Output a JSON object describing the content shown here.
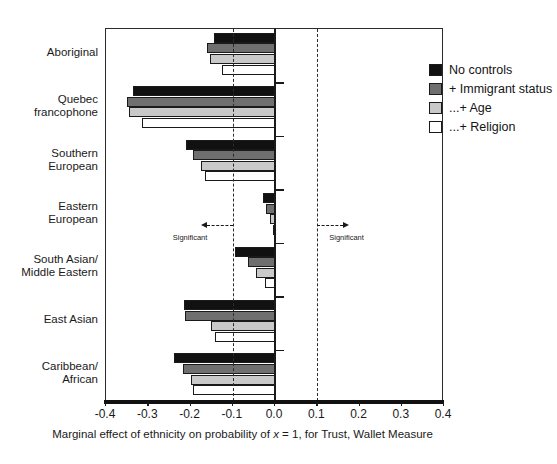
{
  "chart_data": {
    "type": "bar",
    "orientation": "horizontal",
    "title": "",
    "xlabel": "Marginal effect of ethnicity on probability of x = 1, for Trust, Wallet Measure",
    "ylabel": "",
    "xlim": [
      -0.4,
      0.4
    ],
    "xticks": [
      "-0.4",
      "-0.3",
      "-0.2",
      "-0.1",
      "0.0",
      "0.1",
      "0.2",
      "0.3",
      "0.4"
    ],
    "xtick_values": [
      -0.4,
      -0.3,
      -0.2,
      -0.1,
      0.0,
      0.1,
      0.2,
      0.3,
      0.4
    ],
    "grid": false,
    "legend_position": "top-right",
    "categories": [
      "Aboriginal",
      "Quebec francophone",
      "Southern European",
      "Eastern European",
      "South Asian/ Middle Eastern",
      "East Asian",
      "Caribbean/ African"
    ],
    "category_lines": [
      [
        "Aboriginal"
      ],
      [
        "Quebec",
        "francophone"
      ],
      [
        "Southern",
        "European"
      ],
      [
        "Eastern",
        "European"
      ],
      [
        "South Asian/",
        "Middle Eastern"
      ],
      [
        "East Asian"
      ],
      [
        "Caribbean/",
        "African"
      ]
    ],
    "series": [
      {
        "name": "No controls",
        "color": "#111111",
        "values": [
          -0.145,
          -0.335,
          -0.21,
          -0.028,
          -0.095,
          -0.215,
          -0.24
        ]
      },
      {
        "name": "+ Immigrant status",
        "color": "#6f6f6f",
        "values": [
          -0.16,
          -0.35,
          -0.195,
          -0.022,
          -0.064,
          -0.212,
          -0.218
        ]
      },
      {
        "name": "...+ Age",
        "color": "#c9c9c9",
        "values": [
          -0.155,
          -0.345,
          -0.175,
          -0.012,
          -0.045,
          -0.152,
          -0.2
        ]
      },
      {
        "name": "...+ Religion",
        "color": "#ffffff",
        "values": [
          -0.125,
          -0.315,
          -0.165,
          -0.005,
          -0.024,
          -0.142,
          -0.195
        ]
      }
    ],
    "reference_lines": [
      {
        "value": 0.0,
        "style": "solid",
        "label": "zero"
      },
      {
        "value": -0.1,
        "style": "dashed",
        "label": "significance-negative"
      },
      {
        "value": 0.1,
        "style": "dashed",
        "label": "significance-positive"
      }
    ],
    "annotations": [
      {
        "text": "Significant",
        "at": -0.1,
        "direction": "left"
      },
      {
        "text": "Significant",
        "at": 0.1,
        "direction": "right"
      }
    ]
  },
  "legend": {
    "items": [
      {
        "label": "No controls",
        "color": "#111111"
      },
      {
        "label": "+ Immigrant status",
        "color": "#6f6f6f"
      },
      {
        "label": "...+ Age",
        "color": "#c9c9c9"
      },
      {
        "label": "...+ Religion",
        "color": "#ffffff"
      }
    ]
  },
  "axis": {
    "x_title_parts": [
      "Marginal effect of ethnicity on probability of ",
      "x",
      " = 1, for Trust, Wallet Measure"
    ]
  }
}
